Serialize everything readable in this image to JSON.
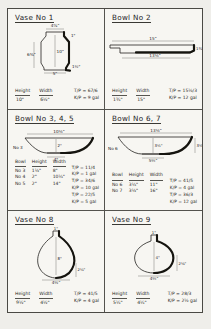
{
  "sheet": {
    "panels": [
      {
        "id": "vase-1",
        "title": "Vase No 1",
        "shape": "cylindrical-jar",
        "dims": {
          "top_width": "4⅞\"",
          "height_inner": "10\"",
          "side_height": "6⅜\"",
          "base_width": "5\"",
          "rim_note": "1\"",
          "foot_note": "1½\""
        },
        "specs": {
          "headers": [
            "Height",
            "Width"
          ],
          "values": [
            "10\"",
            "6½\""
          ],
          "formulas": [
            "T/P = 67/6",
            "K/P = 9 gal"
          ]
        }
      },
      {
        "id": "bowl-2",
        "title": "Bowl No 2",
        "shape": "shallow-platter",
        "dims": {
          "top_width": "15\"",
          "base_width": "13½\"",
          "height": "1¾\""
        },
        "specs": {
          "headers": [
            "Height",
            "Width"
          ],
          "values": [
            "1¾\"",
            "15\""
          ],
          "formulas": [
            "T/P = 15½/3",
            "K/P = 12 gal"
          ]
        }
      },
      {
        "id": "bowl-345",
        "title": "Bowl No 3, 4, 5",
        "shape": "wide-bowl",
        "dims": {
          "top_width": "10½\"",
          "base_width": "4\"",
          "height": "2\"",
          "side_label": "No 3"
        },
        "table": {
          "headers": [
            "Bowl",
            "Height",
            "Width"
          ],
          "rows": [
            {
              "bowl": "No 3",
              "height": "1½\"",
              "width": "8\""
            },
            {
              "bowl": "No 4",
              "height": "2\"",
              "width": "10¼\""
            },
            {
              "bowl": "No 5",
              "height": "2\"",
              "width": "14\""
            }
          ],
          "formulas": [
            [
              "T/P = 11/4",
              "K/P = 1 gal"
            ],
            [
              "T/P = 34/6",
              "K/P = 10 gal"
            ],
            [
              "T/P = 22/5",
              "K/P = 5 gal"
            ]
          ]
        }
      },
      {
        "id": "bowl-67",
        "title": "Bowl No 6, 7",
        "shape": "wide-bowl",
        "dims": {
          "top_width": "13½\"",
          "base_width": "5¼\"",
          "height": "3½\"",
          "side_label": "No 6",
          "right_label": "3½\""
        },
        "table": {
          "headers": [
            "Bowl",
            "Height",
            "Width"
          ],
          "rows": [
            {
              "bowl": "No 6",
              "height": "3¼\"",
              "width": "11\""
            },
            {
              "bowl": "No 7",
              "height": "3½\"",
              "width": "16\""
            }
          ],
          "formulas": [
            [
              "T/P = 41/5",
              "K/P = 4 gal"
            ],
            [
              "T/P = 36/3",
              "K/P = 12 gal"
            ]
          ]
        }
      },
      {
        "id": "vase-8",
        "title": "Vase No 8",
        "shape": "teardrop",
        "dims": {
          "neck": "1\"",
          "height_inner": "8\"",
          "base_width": "4½\"",
          "right_note": "2¼\""
        },
        "specs": {
          "headers": [
            "Height",
            "Width"
          ],
          "values": [
            "9½\"",
            "4½\""
          ],
          "formulas": [
            "T/P = 41/5",
            "K/P = 4 gal"
          ]
        }
      },
      {
        "id": "vase-9",
        "title": "Vase No 9",
        "shape": "onion-bulb",
        "dims": {
          "neck": "1\"",
          "height_inner": "4\"",
          "base_width": "4¼\"",
          "right_note": "2⅛\""
        },
        "specs": {
          "headers": [
            "Height",
            "Width"
          ],
          "values": [
            "5¼\"",
            "4¼\""
          ],
          "formulas": [
            "T/P = 28/3",
            "K/P = 2½ gal"
          ]
        }
      }
    ]
  }
}
